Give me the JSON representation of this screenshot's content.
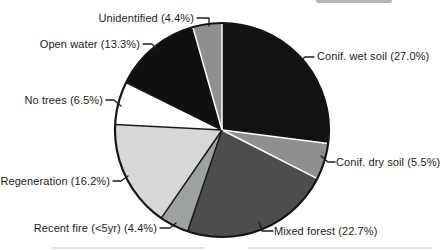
{
  "chart_data": {
    "type": "pie",
    "clockwise": true,
    "start_at": "12-oclock",
    "unit": "%",
    "center": {
      "x": 222,
      "y": 130
    },
    "radius": 107,
    "outline_color": "#141414",
    "leader_color": "#1c1c1c",
    "label_color": "#1c1c1c",
    "slices": [
      {
        "name": "Conif. wet soil",
        "value": 27.0,
        "display": "Conif. wet soil (27.0%)",
        "color": "#121212",
        "sep_before": "#ffffff",
        "leader": [
          [
            298,
            63
          ],
          [
            305,
            57
          ],
          [
            314,
            57
          ]
        ]
      },
      {
        "name": "Conif. dry soil",
        "value": 5.5,
        "display": "Conif. dry soil (5.5%)",
        "color": "#8e9090",
        "sep_before": "#ffffff",
        "leader": [
          [
            321,
            156
          ],
          [
            328,
            162
          ],
          [
            335,
            162
          ]
        ]
      },
      {
        "name": "Mixed forest",
        "value": 22.7,
        "display": "Mixed forest (22.7%)",
        "color": "#4c4e4e",
        "sep_before": "#ffffff",
        "leader": [
          [
            259,
            222
          ],
          [
            262,
            231
          ],
          [
            273,
            231
          ]
        ]
      },
      {
        "name": "Recent fire (<5yr)",
        "value": 4.4,
        "display": "Recent fire (<5yr) (4.4%)",
        "color": "#9da1a1",
        "sep_before": "#1a1a1a",
        "leader": [
          [
            160,
            228
          ],
          [
            170,
            228
          ],
          [
            176,
            223
          ]
        ]
      },
      {
        "name": "Regeneration",
        "value": 16.2,
        "display": "Regeneration (16.2%)",
        "color": "#d6d8d8",
        "sep_before": "#1a1a1a",
        "leader": [
          [
            113,
            181
          ],
          [
            121,
            181
          ],
          [
            128,
            176
          ]
        ]
      },
      {
        "name": "No trees",
        "value": 6.5,
        "display": "No trees (6.5%)",
        "color": "#ffffff",
        "sep_before": "#1a1a1a",
        "leader": [
          [
            106,
            100
          ],
          [
            114,
            100
          ],
          [
            121,
            106
          ]
        ]
      },
      {
        "name": "Open water",
        "value": 13.3,
        "display": "Open water (13.3%)",
        "color": "#101010",
        "sep_before": "#1a1a1a",
        "leader": [
          [
            143,
            44
          ],
          [
            152,
            44
          ],
          [
            158,
            50
          ]
        ]
      },
      {
        "name": "Unidentified",
        "value": 4.4,
        "display": "Unidentified (4.4%)",
        "color": "#8e9090",
        "sep_before": "#ffffff",
        "leader": [
          [
            197,
            18
          ],
          [
            209,
            18
          ],
          [
            209,
            26
          ]
        ]
      }
    ]
  }
}
